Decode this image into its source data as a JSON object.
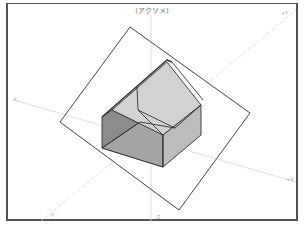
{
  "view": {
    "title": "(アクソメ)",
    "axis_labels": {
      "x_pos": "+X",
      "x_neg": "-X",
      "y_pos": "+Y",
      "y_neg": "-Y",
      "z_neg": "-Z"
    }
  },
  "colors": {
    "frame": "#555555",
    "outline": "#333333",
    "axis": "#dddddd",
    "wall_dark": "#8c8c8c",
    "roof": "#d2d2d2",
    "wall_light": "#bdbdbd"
  },
  "geometry": {
    "ground_rect": [
      [
        130,
        27
      ],
      [
        250,
        113
      ],
      [
        179,
        210
      ],
      [
        60,
        122
      ]
    ],
    "house": {
      "left_wall": [
        [
          102,
          117
        ],
        [
          112,
          110
        ],
        [
          163,
          135
        ],
        [
          163,
          167
        ],
        [
          102,
          148
        ]
      ],
      "roof": [
        [
          112,
          110
        ],
        [
          167,
          62
        ],
        [
          201,
          105
        ],
        [
          163,
          135
        ]
      ],
      "right_wall": [
        [
          163,
          135
        ],
        [
          201,
          105
        ],
        [
          201,
          135
        ],
        [
          163,
          167
        ]
      ]
    }
  }
}
